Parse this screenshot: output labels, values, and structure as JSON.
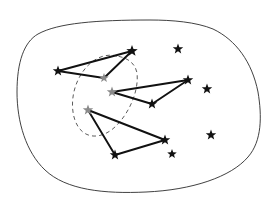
{
  "figure": {
    "width": 277,
    "height": 204,
    "background_color": "#ffffff"
  },
  "colors": {
    "region_outline": "#2b2b2b",
    "cluster_outline": "#4a4a4a",
    "edge": "#111111",
    "star_dark": "#111111",
    "star_gray": "#8a8a8a"
  },
  "region": {
    "name": "outer-region-boundary",
    "style": "solid",
    "path": "M 150 20 C 96 20 58 23 38 34 C 24 42 17 62 17 92 C 17 122 26 152 45 170 C 66 190 104 194 146 192 C 192 190 231 177 248 157 C 262 141 262 116 258 92 C 252 62 236 40 213 29 C 196 22 172 20 150 20 Z"
  },
  "cluster": {
    "name": "dashed-subcluster-boundary",
    "style": "dashed",
    "dash_pattern": "4 3.2",
    "path": "M 117 56 C 101 52 86 63 78 80 C 70 97 71 117 79 128 C 88 140 104 138 116 126 C 130 112 139 90 137 73 C 135 63 128 58 117 56 Z"
  },
  "stars": [
    {
      "id": "s1",
      "name": "star-upper-left",
      "x": 58,
      "y": 71,
      "size": 11,
      "tone": "dark",
      "in_cluster": false
    },
    {
      "id": "s2",
      "name": "star-upper-apex",
      "x": 132,
      "y": 51,
      "size": 12,
      "tone": "dark",
      "in_cluster": false
    },
    {
      "id": "s3",
      "name": "star-upper-mid",
      "x": 104,
      "y": 78,
      "size": 10,
      "tone": "gray",
      "in_cluster": true
    },
    {
      "id": "s4",
      "name": "star-middle-left",
      "x": 112,
      "y": 92,
      "size": 11,
      "tone": "gray",
      "in_cluster": true
    },
    {
      "id": "s5",
      "name": "star-middle-right",
      "x": 188,
      "y": 80,
      "size": 11,
      "tone": "dark",
      "in_cluster": false
    },
    {
      "id": "s6",
      "name": "star-middle-bottom",
      "x": 152,
      "y": 104,
      "size": 11,
      "tone": "dark",
      "in_cluster": false
    },
    {
      "id": "s7",
      "name": "star-lower-left",
      "x": 88,
      "y": 110,
      "size": 11,
      "tone": "gray",
      "in_cluster": true
    },
    {
      "id": "s8",
      "name": "star-lower-right",
      "x": 165,
      "y": 140,
      "size": 11,
      "tone": "dark",
      "in_cluster": false
    },
    {
      "id": "s9",
      "name": "star-lower-bottom",
      "x": 115,
      "y": 155,
      "size": 11,
      "tone": "dark",
      "in_cluster": false
    },
    {
      "id": "s10",
      "name": "star-isolated-top-right",
      "x": 178,
      "y": 49,
      "size": 11,
      "tone": "dark",
      "in_cluster": false
    },
    {
      "id": "s11",
      "name": "star-isolated-right",
      "x": 207,
      "y": 89,
      "size": 11,
      "tone": "dark",
      "in_cluster": false
    },
    {
      "id": "s12",
      "name": "star-isolated-lower-right",
      "x": 211,
      "y": 135,
      "size": 11,
      "tone": "dark",
      "in_cluster": false
    },
    {
      "id": "s13",
      "name": "star-isolated-bottom-middle",
      "x": 172,
      "y": 154,
      "size": 10,
      "tone": "dark",
      "in_cluster": false
    }
  ],
  "edges": [
    {
      "name": "edge-upper-left-to-apex",
      "from": "s1",
      "to": "s2"
    },
    {
      "name": "edge-upper-left-to-mid",
      "from": "s1",
      "to": "s3"
    },
    {
      "name": "edge-upper-mid-to-apex",
      "from": "s3",
      "to": "s2"
    },
    {
      "name": "edge-middle-left-to-right",
      "from": "s4",
      "to": "s5"
    },
    {
      "name": "edge-middle-left-to-bottom",
      "from": "s4",
      "to": "s6"
    },
    {
      "name": "edge-middle-bottom-to-right",
      "from": "s6",
      "to": "s5"
    },
    {
      "name": "edge-lower-left-to-right",
      "from": "s7",
      "to": "s8"
    },
    {
      "name": "edge-lower-left-to-bottom",
      "from": "s7",
      "to": "s9"
    },
    {
      "name": "edge-lower-bottom-to-right",
      "from": "s9",
      "to": "s8"
    }
  ]
}
